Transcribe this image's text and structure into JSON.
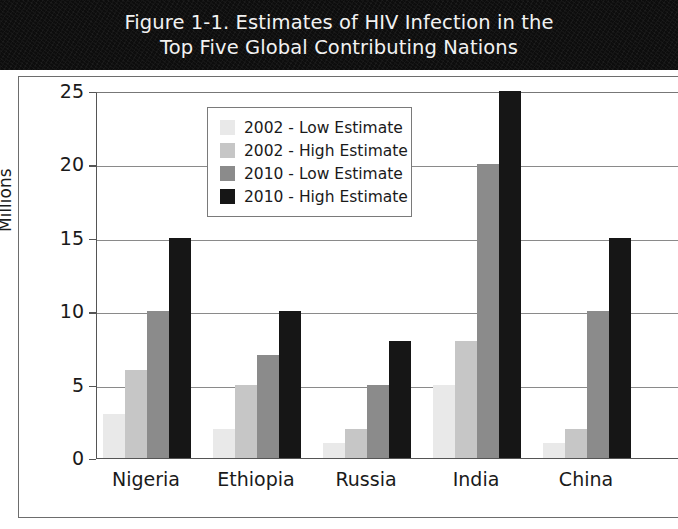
{
  "figure": {
    "title": "Figure 1-1. Estimates of HIV Infection in the\nTop Five Global Contributing Nations"
  },
  "chart_data": {
    "type": "bar",
    "title": "Figure 1-1. Estimates of HIV Infection in the Top Five Global Contributing Nations",
    "xlabel": "",
    "ylabel": "Millions",
    "ylim": [
      0,
      25
    ],
    "yticks": [
      "0",
      "5",
      "10",
      "15",
      "20",
      "25"
    ],
    "grid": true,
    "legend_position": "upper-left-inside",
    "categories": [
      "Nigeria",
      "Ethiopia",
      "Russia",
      "India",
      "China"
    ],
    "series": [
      {
        "name": "2002 - Low Estimate",
        "color": "#e9e9e9",
        "values": [
          3,
          2,
          1,
          5,
          1
        ]
      },
      {
        "name": "2002 - High Estimate",
        "color": "#c6c6c6",
        "values": [
          6,
          5,
          2,
          8,
          2
        ]
      },
      {
        "name": "2010 - Low Estimate",
        "color": "#8b8b8b",
        "values": [
          10,
          7,
          5,
          20,
          10
        ]
      },
      {
        "name": "2010 - High Estimate",
        "color": "#161616",
        "values": [
          15,
          10,
          8,
          25,
          15
        ]
      }
    ]
  }
}
